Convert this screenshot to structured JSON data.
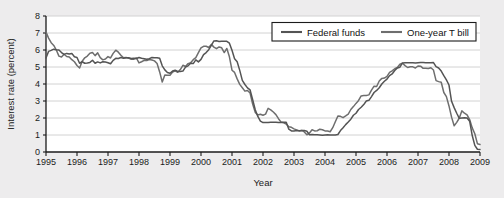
{
  "chart_data": {
    "type": "line",
    "title": "",
    "xlabel": "Year",
    "ylabel": "Interest rate (percent)",
    "xlim": [
      1995,
      2009
    ],
    "ylim": [
      0,
      8
    ],
    "ytick_step": 1,
    "grid": "horizontal",
    "legend_position": "top-right",
    "xticks": [
      "1995",
      "1996",
      "1997",
      "1998",
      "1999",
      "2000",
      "2001",
      "2002",
      "2003",
      "2004",
      "2005",
      "2006",
      "2007",
      "2008",
      "2009"
    ],
    "yticks": [
      "0",
      "1",
      "2",
      "3",
      "4",
      "5",
      "6",
      "7",
      "8"
    ],
    "colors": {
      "federal_funds": "#545454",
      "one_year_t_bill": "#6e6e6e",
      "grid": "#d2d2d2",
      "axis": "#1b1b1b",
      "plot_background": "#ffffff",
      "page_background": "#edeced"
    },
    "x_start": 1995.0,
    "x_step": 0.08333,
    "series": [
      {
        "name": "Federal funds",
        "values": [
          5.53,
          5.92,
          5.98,
          6.05,
          6.01,
          6.0,
          5.85,
          5.74,
          5.8,
          5.76,
          5.8,
          5.6,
          5.56,
          5.22,
          5.31,
          5.22,
          5.24,
          5.27,
          5.4,
          5.22,
          5.3,
          5.24,
          5.31,
          5.29,
          5.25,
          5.19,
          5.39,
          5.51,
          5.5,
          5.56,
          5.52,
          5.54,
          5.54,
          5.5,
          5.52,
          5.5,
          5.56,
          5.51,
          5.49,
          5.45,
          5.49,
          5.56,
          5.54,
          5.55,
          5.51,
          5.07,
          4.83,
          4.68,
          4.63,
          4.76,
          4.81,
          4.74,
          4.74,
          4.76,
          4.99,
          5.07,
          5.22,
          5.2,
          5.42,
          5.3,
          5.45,
          5.73,
          5.85,
          6.02,
          6.27,
          6.53,
          6.54,
          6.5,
          6.52,
          6.51,
          6.51,
          6.4,
          5.98,
          5.49,
          5.31,
          4.8,
          4.21,
          3.97,
          3.77,
          3.65,
          3.07,
          2.49,
          2.09,
          1.82,
          1.73,
          1.74,
          1.73,
          1.75,
          1.75,
          1.75,
          1.73,
          1.74,
          1.75,
          1.75,
          1.34,
          1.24,
          1.24,
          1.26,
          1.25,
          1.26,
          1.26,
          1.22,
          1.01,
          1.03,
          1.01,
          1.01,
          1.0,
          0.98,
          1.0,
          1.01,
          1.0,
          1.0,
          1.0,
          1.03,
          1.26,
          1.43,
          1.61,
          1.76,
          1.93,
          2.16,
          2.28,
          2.5,
          2.63,
          2.79,
          3.0,
          3.04,
          3.26,
          3.5,
          3.62,
          3.78,
          4.0,
          4.16,
          4.29,
          4.49,
          4.59,
          4.79,
          4.94,
          4.99,
          5.24,
          5.25,
          5.25,
          5.25,
          5.25,
          5.24,
          5.25,
          5.26,
          5.26,
          5.25,
          5.25,
          5.25,
          5.26,
          5.02,
          4.94,
          4.76,
          4.49,
          4.24,
          3.94,
          2.98,
          2.61,
          2.28,
          1.98,
          2.0,
          2.01,
          2.0,
          1.81,
          0.97,
          0.39,
          0.16,
          0.15
        ]
      },
      {
        "name": "One-year T bill",
        "values": [
          7.05,
          6.7,
          6.43,
          6.27,
          6.0,
          5.64,
          5.59,
          5.75,
          5.62,
          5.59,
          5.43,
          5.31,
          5.09,
          4.94,
          5.34,
          5.54,
          5.64,
          5.81,
          5.85,
          5.67,
          5.83,
          5.55,
          5.42,
          5.47,
          5.61,
          5.53,
          5.8,
          5.99,
          5.87,
          5.69,
          5.54,
          5.56,
          5.52,
          5.46,
          5.46,
          5.53,
          5.24,
          5.31,
          5.39,
          5.38,
          5.44,
          5.41,
          5.36,
          5.21,
          4.71,
          4.12,
          4.53,
          4.52,
          4.52,
          4.7,
          4.78,
          4.69,
          4.85,
          5.1,
          5.03,
          5.2,
          5.25,
          5.43,
          5.55,
          5.84,
          6.12,
          6.22,
          6.22,
          6.15,
          6.33,
          6.17,
          6.08,
          6.18,
          6.13,
          5.85,
          6.09,
          5.6,
          4.81,
          4.68,
          4.3,
          3.98,
          3.78,
          3.58,
          3.62,
          3.47,
          2.82,
          2.33,
          2.18,
          2.22,
          2.16,
          2.23,
          2.57,
          2.48,
          2.35,
          2.2,
          1.96,
          1.76,
          1.72,
          1.65,
          1.49,
          1.45,
          1.36,
          1.3,
          1.24,
          1.27,
          1.18,
          1.01,
          1.12,
          1.31,
          1.24,
          1.25,
          1.34,
          1.31,
          1.24,
          1.24,
          1.19,
          1.43,
          1.78,
          2.12,
          2.1,
          2.02,
          2.12,
          2.23,
          2.5,
          2.67,
          2.86,
          3.03,
          3.3,
          3.32,
          3.33,
          3.36,
          3.64,
          3.87,
          3.85,
          4.18,
          4.33,
          4.35,
          4.45,
          4.68,
          4.77,
          4.9,
          4.97,
          5.16,
          5.22,
          5.08,
          4.97,
          5.01,
          5.01,
          4.94,
          5.06,
          5.05,
          4.92,
          4.93,
          4.91,
          4.96,
          4.82,
          4.2,
          4.14,
          4.1,
          3.5,
          3.26,
          2.71,
          2.05,
          1.54,
          1.74,
          2.0,
          2.42,
          2.28,
          2.18,
          1.91,
          1.42,
          1.07,
          0.49,
          0.44
        ]
      }
    ]
  },
  "legend": {
    "items": [
      {
        "label": "Federal funds"
      },
      {
        "label": "One-year T bill"
      }
    ]
  }
}
